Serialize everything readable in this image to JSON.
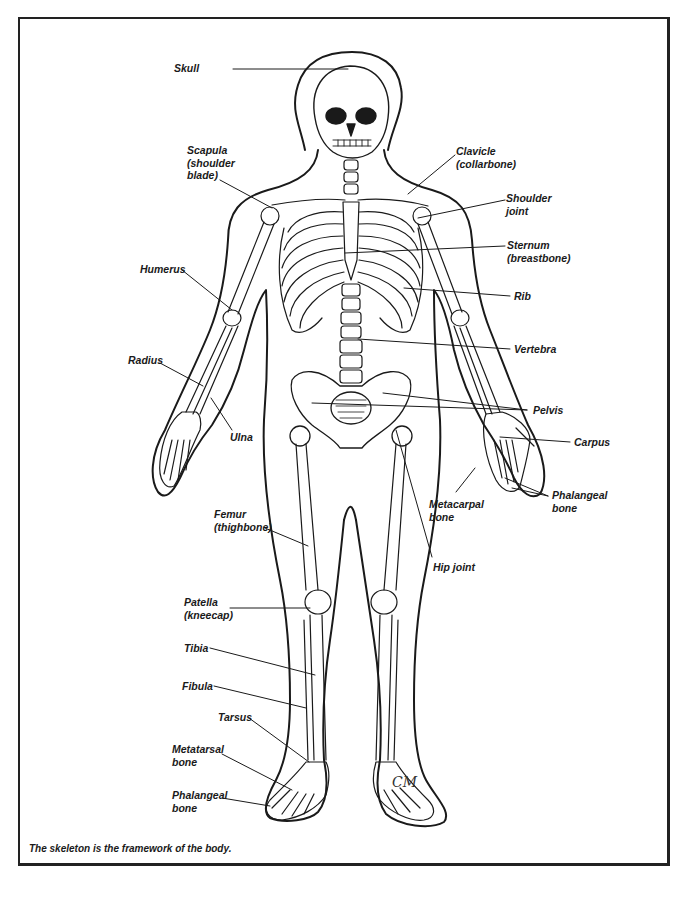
{
  "figure": {
    "caption": "The skeleton is the framework of the body.",
    "signature": "CM",
    "colors": {
      "ink": "#1a1a1a",
      "frame": "#222222",
      "background": "#ffffff"
    }
  },
  "labels": [
    {
      "id": "skull",
      "text": "Skull",
      "x": 174,
      "y": 62,
      "align": "left",
      "line": [
        [
          233,
          69
        ],
        [
          348,
          69
        ]
      ]
    },
    {
      "id": "scapula",
      "text": "Scapula\n(shoulder\nblade)",
      "x": 187,
      "y": 144,
      "align": "left",
      "line": [
        [
          220,
          180
        ],
        [
          272,
          208
        ]
      ]
    },
    {
      "id": "clavicle",
      "text": "Clavicle\n(collarbone)",
      "x": 456,
      "y": 145,
      "align": "left",
      "line": [
        [
          455,
          155
        ],
        [
          408,
          194
        ]
      ]
    },
    {
      "id": "shoulder-joint",
      "text": "Shoulder\njoint",
      "x": 506,
      "y": 192,
      "align": "left",
      "line": [
        [
          505,
          200
        ],
        [
          418,
          218
        ]
      ]
    },
    {
      "id": "sternum",
      "text": "Sternum\n(breastbone)",
      "x": 507,
      "y": 239,
      "align": "left",
      "line": [
        [
          505,
          246
        ],
        [
          345,
          253
        ]
      ]
    },
    {
      "id": "rib",
      "text": "Rib",
      "x": 514,
      "y": 290,
      "align": "left",
      "line": [
        [
          510,
          296
        ],
        [
          404,
          288
        ]
      ]
    },
    {
      "id": "humerus",
      "text": "Humerus",
      "x": 140,
      "y": 263,
      "align": "left",
      "line": [
        [
          182,
          270
        ],
        [
          232,
          310
        ]
      ]
    },
    {
      "id": "vertebra",
      "text": "Vertebra",
      "x": 514,
      "y": 343,
      "align": "left",
      "line": [
        [
          510,
          349
        ],
        [
          358,
          339
        ]
      ]
    },
    {
      "id": "radius",
      "text": "Radius",
      "x": 128,
      "y": 354,
      "align": "left",
      "line": [
        [
          160,
          363
        ],
        [
          203,
          386
        ]
      ]
    },
    {
      "id": "pelvis",
      "text": "Pelvis",
      "x": 533,
      "y": 404,
      "align": "left",
      "lines": [
        [
          [
            527,
            410
          ],
          [
            383,
            393
          ]
        ],
        [
          [
            527,
            410
          ],
          [
            312,
            403
          ]
        ]
      ]
    },
    {
      "id": "ulna",
      "text": "Ulna",
      "x": 230,
      "y": 431,
      "align": "left",
      "line": [
        [
          232,
          430
        ],
        [
          211,
          398
        ]
      ]
    },
    {
      "id": "carpus",
      "text": "Carpus",
      "x": 574,
      "y": 436,
      "align": "left",
      "line": [
        [
          570,
          442
        ],
        [
          500,
          437
        ]
      ]
    },
    {
      "id": "metacarpal",
      "text": "Metacarpal\nbone",
      "x": 429,
      "y": 498,
      "align": "left",
      "line": [
        [
          456,
          492
        ],
        [
          475,
          468
        ]
      ]
    },
    {
      "id": "phalangeal-hand",
      "text": "Phalangeal\nbone",
      "x": 552,
      "y": 489,
      "align": "left",
      "lines": [
        [
          [
            548,
            496
          ],
          [
            505,
            478
          ]
        ],
        [
          [
            548,
            496
          ],
          [
            512,
            488
          ]
        ]
      ]
    },
    {
      "id": "femur",
      "text": "Femur\n(thighbone)",
      "x": 214,
      "y": 508,
      "align": "left",
      "line": [
        [
          265,
          528
        ],
        [
          308,
          546
        ]
      ]
    },
    {
      "id": "hip-joint",
      "text": "Hip joint",
      "x": 433,
      "y": 561,
      "align": "left",
      "line": [
        [
          432,
          557
        ],
        [
          396,
          430
        ]
      ]
    },
    {
      "id": "patella",
      "text": "Patella\n(kneecap)",
      "x": 184,
      "y": 596,
      "align": "left",
      "line": [
        [
          230,
          608
        ],
        [
          310,
          608
        ]
      ]
    },
    {
      "id": "tibia",
      "text": "Tibia",
      "x": 184,
      "y": 642,
      "align": "left",
      "line": [
        [
          210,
          648
        ],
        [
          315,
          675
        ]
      ]
    },
    {
      "id": "fibula",
      "text": "Fibula",
      "x": 182,
      "y": 680,
      "align": "left",
      "line": [
        [
          214,
          686
        ],
        [
          306,
          708
        ]
      ]
    },
    {
      "id": "tarsus",
      "text": "Tarsus",
      "x": 218,
      "y": 711,
      "align": "left",
      "line": [
        [
          249,
          718
        ],
        [
          309,
          762
        ]
      ]
    },
    {
      "id": "metatarsal",
      "text": "Metatarsal\nbone",
      "x": 172,
      "y": 743,
      "align": "left",
      "line": [
        [
          222,
          754
        ],
        [
          292,
          790
        ]
      ]
    },
    {
      "id": "phalangeal-foot",
      "text": "Phalangeal\nbone",
      "x": 172,
      "y": 789,
      "align": "left",
      "line": [
        [
          222,
          798
        ],
        [
          270,
          806
        ]
      ]
    }
  ]
}
